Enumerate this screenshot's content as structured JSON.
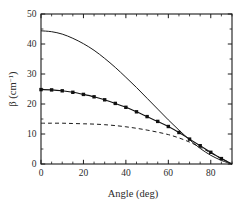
{
  "chart_data": {
    "type": "line",
    "title": "",
    "xlabel": "Angle (deg)",
    "ylabel": "β (cm⁻¹)",
    "ylabel_symbol": "β",
    "ylabel_unit_base": " (cm",
    "ylabel_unit_exp": "−1",
    "ylabel_unit_close": ")",
    "xlim": [
      0,
      90
    ],
    "ylim": [
      0,
      50
    ],
    "xticks": [
      0,
      20,
      40,
      60,
      80
    ],
    "xtick_labels": [
      "0",
      "20",
      "40",
      "60",
      "80"
    ],
    "yticks": [
      0,
      10,
      20,
      30,
      40,
      50
    ],
    "ytick_labels": [
      "0",
      "10",
      "20",
      "30",
      "40",
      "50"
    ],
    "x_minor_step": 5,
    "y_minor_step": 5,
    "grid": false,
    "legend": "none",
    "x": [
      0,
      5,
      10,
      15,
      20,
      25,
      30,
      35,
      40,
      45,
      50,
      55,
      60,
      65,
      70,
      75,
      80,
      85,
      90
    ],
    "series": [
      {
        "name": "upper-solid",
        "style": "solid",
        "marker": "none",
        "color": "#1a1a1a",
        "values": [
          44.4,
          44.1,
          43.3,
          41.9,
          40.1,
          37.9,
          35.2,
          32.2,
          28.9,
          25.5,
          21.9,
          18.3,
          14.7,
          11.3,
          8.1,
          5.2,
          2.9,
          1.2,
          0.0
        ]
      },
      {
        "name": "middle-squares",
        "style": "solid",
        "marker": "square",
        "color": "#111111",
        "values": [
          24.8,
          24.7,
          24.4,
          23.9,
          23.2,
          22.4,
          21.4,
          20.2,
          18.9,
          17.4,
          15.8,
          14.2,
          12.5,
          10.5,
          8.3,
          6.1,
          3.9,
          1.8,
          0.0
        ]
      },
      {
        "name": "lower-dashed",
        "style": "dashed",
        "marker": "none",
        "color": "#1a1a1a",
        "values": [
          13.6,
          13.6,
          13.6,
          13.5,
          13.4,
          13.3,
          13.1,
          12.8,
          12.4,
          11.9,
          11.3,
          10.6,
          9.8,
          8.7,
          7.3,
          5.6,
          3.7,
          1.8,
          0.0
        ]
      }
    ]
  },
  "axes": {
    "x_axis_name": "Angle (deg)",
    "y_axis_name": "β (cm⁻¹)"
  }
}
